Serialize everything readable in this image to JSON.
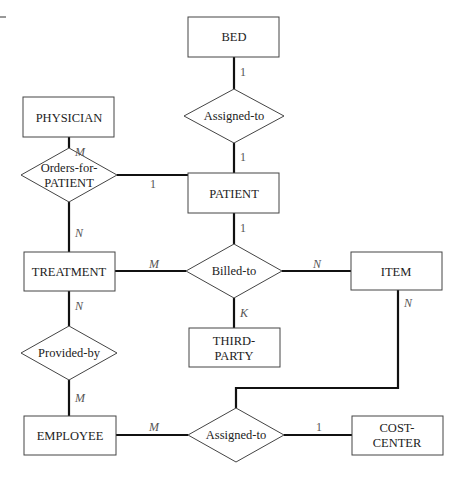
{
  "diagram": {
    "type": "ER diagram",
    "entities": {
      "bed": "BED",
      "physician": "PHYSICIAN",
      "patient": "PATIENT",
      "treatment": "TREATMENT",
      "item": "ITEM",
      "third_party": [
        "THIRD-",
        "PARTY"
      ],
      "employee": "EMPLOYEE",
      "cost_center": [
        "COST-",
        "CENTER"
      ]
    },
    "relationships": {
      "assigned_to_bed": "Assigned-to",
      "orders_for_patient": [
        "Orders-for-",
        "PATIENT"
      ],
      "billed_to": "Billed-to",
      "provided_by": "Provided-by",
      "assigned_to_cost": "Assigned-to"
    },
    "cardinalities": {
      "bed_assigned": "1",
      "assigned_patient": "1",
      "physician_orders": "M",
      "orders_patient": "1",
      "orders_treatment": "N",
      "patient_billed": "1",
      "treatment_billed": "M",
      "billed_item": "N",
      "billed_thirdparty": "K",
      "treatment_provided": "N",
      "provided_employee": "M",
      "item_assigned": "N",
      "employee_assigned": "M",
      "assigned_costcenter": "1"
    }
  }
}
